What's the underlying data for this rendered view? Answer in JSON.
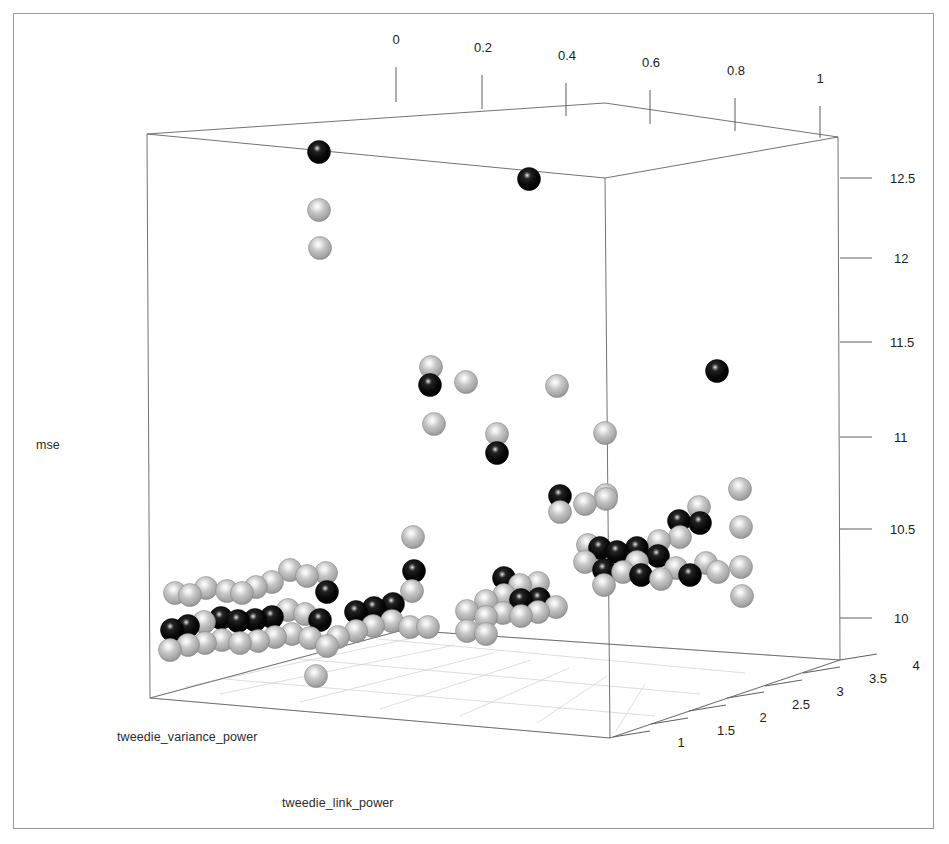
{
  "figure": {
    "background": "#ffffff",
    "frame_color": "#9a9a9a",
    "box_line_color": "#5a5a5a",
    "grid_color": "#d0d0d0"
  },
  "axes": {
    "x": {
      "name": "tweedie_variance_power",
      "label": "tweedie_variance_power",
      "position": "top",
      "ticks": [
        "0",
        "0.2",
        "0.4",
        "0.6",
        "0.8",
        "1"
      ],
      "tick_values": [
        0,
        0.2,
        0.4,
        0.6,
        0.8,
        1
      ],
      "range": [
        0,
        1
      ]
    },
    "y": {
      "name": "tweedie_link_power",
      "label": "tweedie_link_power",
      "position": "bottom-right",
      "ticks": [
        "1",
        "1.5",
        "2",
        "2.5",
        "3",
        "3.5",
        "4"
      ],
      "tick_values": [
        1,
        1.5,
        2,
        2.5,
        3,
        3.5,
        4
      ],
      "range": [
        1,
        4
      ]
    },
    "z": {
      "name": "mse",
      "label": "mse",
      "position": "right",
      "ticks": [
        "10",
        "10.5",
        "11",
        "11.5",
        "12",
        "12.5"
      ],
      "tick_values": [
        10,
        10.5,
        11,
        11.5,
        12,
        12.5
      ],
      "range": [
        9.75,
        12.75
      ]
    }
  },
  "chart_data": {
    "type": "scatter",
    "subtype": "scatter3d",
    "title": "",
    "xlabel": "tweedie_variance_power",
    "ylabel": "tweedie_link_power",
    "zlabel": "mse",
    "xlim": [
      0,
      1
    ],
    "ylim": [
      1,
      4
    ],
    "zlim": [
      9.75,
      12.75
    ],
    "grid": true,
    "legend": "none",
    "marker": {
      "shape": "sphere",
      "diameter_px": 23,
      "colors": {
        "light": "#b4b4b4",
        "dark": "#0d0d0d",
        "highlight": "#ffffff"
      }
    },
    "note": "Marker screen positions (px) and fill class as rendered; z value estimated from the mse axis.",
    "points": [
      {
        "px": 319,
        "py": 152,
        "c": "dark",
        "mse": 12.62
      },
      {
        "px": 319,
        "py": 210,
        "c": "light",
        "mse": 12.29
      },
      {
        "px": 320,
        "py": 248,
        "c": "light",
        "mse": 12.07
      },
      {
        "px": 529,
        "py": 179,
        "c": "dark",
        "mse": 12.47
      },
      {
        "px": 717,
        "py": 371,
        "c": "dark",
        "mse": 11.39
      },
      {
        "px": 430,
        "py": 385,
        "c": "dark",
        "mse": 11.31
      },
      {
        "px": 431,
        "py": 367,
        "c": "light",
        "mse": 11.41
      },
      {
        "px": 466,
        "py": 382,
        "c": "light",
        "mse": 11.33
      },
      {
        "px": 434,
        "py": 424,
        "c": "light",
        "mse": 11.09
      },
      {
        "px": 497,
        "py": 453,
        "c": "dark",
        "mse": 10.93
      },
      {
        "px": 497,
        "py": 434,
        "c": "light",
        "mse": 11.04
      },
      {
        "px": 557,
        "py": 386,
        "c": "light",
        "mse": 11.31
      },
      {
        "px": 605,
        "py": 433,
        "c": "light",
        "mse": 11.04
      },
      {
        "px": 606,
        "py": 495,
        "c": "light",
        "mse": 10.69
      },
      {
        "px": 560,
        "py": 496,
        "c": "dark",
        "mse": 10.69
      },
      {
        "px": 560,
        "py": 512,
        "c": "light",
        "mse": 10.6
      },
      {
        "px": 585,
        "py": 504,
        "c": "light",
        "mse": 10.65
      },
      {
        "px": 606,
        "py": 499,
        "c": "light",
        "mse": 10.67
      },
      {
        "px": 413,
        "py": 537,
        "c": "light",
        "mse": 10.46
      },
      {
        "px": 412,
        "py": 591,
        "c": "light",
        "mse": 10.16
      },
      {
        "px": 414,
        "py": 571,
        "c": "dark",
        "mse": 10.27
      },
      {
        "px": 740,
        "py": 489,
        "c": "light",
        "mse": 10.73
      },
      {
        "px": 741,
        "py": 527,
        "c": "light",
        "mse": 10.52
      },
      {
        "px": 741,
        "py": 567,
        "c": "light",
        "mse": 10.3
      },
      {
        "px": 699,
        "py": 507,
        "c": "light",
        "mse": 10.62
      },
      {
        "px": 700,
        "py": 523,
        "c": "dark",
        "mse": 10.53
      },
      {
        "px": 679,
        "py": 521,
        "c": "dark",
        "mse": 10.54
      },
      {
        "px": 680,
        "py": 537,
        "c": "light",
        "mse": 10.45
      },
      {
        "px": 659,
        "py": 541,
        "c": "light",
        "mse": 10.43
      },
      {
        "px": 658,
        "py": 556,
        "c": "dark",
        "mse": 10.35
      },
      {
        "px": 637,
        "py": 548,
        "c": "dark",
        "mse": 10.39
      },
      {
        "px": 637,
        "py": 562,
        "c": "light",
        "mse": 10.32
      },
      {
        "px": 617,
        "py": 552,
        "c": "dark",
        "mse": 10.37
      },
      {
        "px": 600,
        "py": 548,
        "c": "dark",
        "mse": 10.39
      },
      {
        "px": 588,
        "py": 545,
        "c": "light",
        "mse": 10.41
      },
      {
        "px": 585,
        "py": 562,
        "c": "light",
        "mse": 10.32
      },
      {
        "px": 604,
        "py": 570,
        "c": "dark",
        "mse": 10.28
      },
      {
        "px": 604,
        "py": 585,
        "c": "light",
        "mse": 10.19
      },
      {
        "px": 623,
        "py": 572,
        "c": "light",
        "mse": 10.27
      },
      {
        "px": 641,
        "py": 575,
        "c": "dark",
        "mse": 10.26
      },
      {
        "px": 661,
        "py": 579,
        "c": "light",
        "mse": 10.23
      },
      {
        "px": 676,
        "py": 568,
        "c": "light",
        "mse": 10.29
      },
      {
        "px": 690,
        "py": 575,
        "c": "dark",
        "mse": 10.26
      },
      {
        "px": 706,
        "py": 563,
        "c": "light",
        "mse": 10.33
      },
      {
        "px": 718,
        "py": 572,
        "c": "light",
        "mse": 10.27
      },
      {
        "px": 504,
        "py": 595,
        "c": "light",
        "mse": 10.14
      },
      {
        "px": 504,
        "py": 578,
        "c": "dark",
        "mse": 10.23
      },
      {
        "px": 520,
        "py": 585,
        "c": "light",
        "mse": 10.19
      },
      {
        "px": 521,
        "py": 600,
        "c": "dark",
        "mse": 10.11
      },
      {
        "px": 538,
        "py": 583,
        "c": "light",
        "mse": 10.2
      },
      {
        "px": 539,
        "py": 599,
        "c": "dark",
        "mse": 10.12
      },
      {
        "px": 486,
        "py": 601,
        "c": "light",
        "mse": 10.11
      },
      {
        "px": 467,
        "py": 611,
        "c": "light",
        "mse": 10.05
      },
      {
        "px": 486,
        "py": 617,
        "c": "light",
        "mse": 10.02
      },
      {
        "px": 503,
        "py": 613,
        "c": "light",
        "mse": 10.04
      },
      {
        "px": 521,
        "py": 616,
        "c": "light",
        "mse": 10.02
      },
      {
        "px": 538,
        "py": 612,
        "c": "light",
        "mse": 10.05
      },
      {
        "px": 556,
        "py": 607,
        "c": "light",
        "mse": 10.07
      },
      {
        "px": 467,
        "py": 631,
        "c": "light",
        "mse": 9.96
      },
      {
        "px": 486,
        "py": 634,
        "c": "light",
        "mse": 9.94
      },
      {
        "px": 326,
        "py": 573,
        "c": "light",
        "mse": 10.26
      },
      {
        "px": 327,
        "py": 592,
        "c": "dark",
        "mse": 10.15
      },
      {
        "px": 307,
        "py": 576,
        "c": "light",
        "mse": 10.24
      },
      {
        "px": 290,
        "py": 570,
        "c": "light",
        "mse": 10.27
      },
      {
        "px": 272,
        "py": 582,
        "c": "light",
        "mse": 10.21
      },
      {
        "px": 256,
        "py": 587,
        "c": "light",
        "mse": 10.18
      },
      {
        "px": 242,
        "py": 593,
        "c": "light",
        "mse": 10.14
      },
      {
        "px": 227,
        "py": 591,
        "c": "light",
        "mse": 10.15
      },
      {
        "px": 206,
        "py": 588,
        "c": "light",
        "mse": 10.17
      },
      {
        "px": 190,
        "py": 595,
        "c": "light",
        "mse": 10.13
      },
      {
        "px": 175,
        "py": 593,
        "c": "light",
        "mse": 10.14
      },
      {
        "px": 221,
        "py": 618,
        "c": "dark",
        "mse": 10.0
      },
      {
        "px": 238,
        "py": 621,
        "c": "dark",
        "mse": 9.98
      },
      {
        "px": 255,
        "py": 620,
        "c": "dark",
        "mse": 9.99
      },
      {
        "px": 272,
        "py": 617,
        "c": "dark",
        "mse": 10.01
      },
      {
        "px": 288,
        "py": 610,
        "c": "light",
        "mse": 10.05
      },
      {
        "px": 305,
        "py": 614,
        "c": "light",
        "mse": 10.03
      },
      {
        "px": 320,
        "py": 620,
        "c": "dark",
        "mse": 9.99
      },
      {
        "px": 204,
        "py": 622,
        "c": "light",
        "mse": 9.98
      },
      {
        "px": 188,
        "py": 626,
        "c": "dark",
        "mse": 9.96
      },
      {
        "px": 172,
        "py": 630,
        "c": "dark",
        "mse": 9.93
      },
      {
        "px": 188,
        "py": 645,
        "c": "light",
        "mse": 9.85
      },
      {
        "px": 205,
        "py": 643,
        "c": "light",
        "mse": 9.86
      },
      {
        "px": 222,
        "py": 640,
        "c": "light",
        "mse": 9.88
      },
      {
        "px": 240,
        "py": 643,
        "c": "light",
        "mse": 9.86
      },
      {
        "px": 258,
        "py": 641,
        "c": "light",
        "mse": 9.87
      },
      {
        "px": 275,
        "py": 637,
        "c": "light",
        "mse": 9.9
      },
      {
        "px": 292,
        "py": 634,
        "c": "light",
        "mse": 9.92
      },
      {
        "px": 310,
        "py": 638,
        "c": "light",
        "mse": 9.9
      },
      {
        "px": 327,
        "py": 646,
        "c": "light",
        "mse": 9.85
      },
      {
        "px": 170,
        "py": 650,
        "c": "light",
        "mse": 9.82
      },
      {
        "px": 316,
        "py": 676,
        "c": "light",
        "mse": 9.8
      },
      {
        "px": 338,
        "py": 637,
        "c": "light",
        "mse": 9.9
      },
      {
        "px": 356,
        "py": 631,
        "c": "light",
        "mse": 9.93
      },
      {
        "px": 373,
        "py": 626,
        "c": "light",
        "mse": 9.96
      },
      {
        "px": 392,
        "py": 621,
        "c": "light",
        "mse": 9.99
      },
      {
        "px": 410,
        "py": 627,
        "c": "light",
        "mse": 9.95
      },
      {
        "px": 428,
        "py": 627,
        "c": "light",
        "mse": 9.95
      },
      {
        "px": 356,
        "py": 612,
        "c": "dark",
        "mse": 10.05
      },
      {
        "px": 374,
        "py": 608,
        "c": "dark",
        "mse": 10.07
      },
      {
        "px": 393,
        "py": 604,
        "c": "dark",
        "mse": 10.09
      },
      {
        "px": 742,
        "py": 596,
        "c": "light",
        "mse": 10.13
      }
    ]
  },
  "box": {
    "corners": {
      "back_top_left": [
        147,
        134
      ],
      "back_top_right": [
        838,
        137
      ],
      "front_top_left": [
        147,
        182
      ],
      "front_top_right": [
        838,
        185
      ],
      "inner_top": [
        605,
        103
      ],
      "inner_back": [
        605,
        178
      ]
    }
  }
}
